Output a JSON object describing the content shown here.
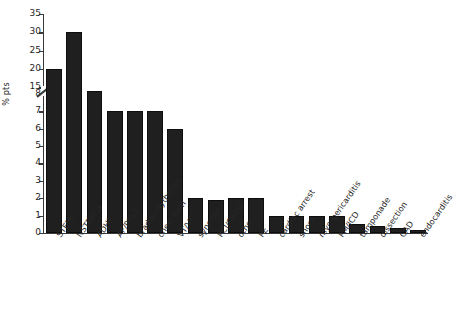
{
  "chart_data": {
    "type": "bar",
    "title": "",
    "subtitle": "",
    "xlabel": "",
    "ylabel": "% pts",
    "grid": false,
    "legend": null,
    "axis_break": {
      "present": true,
      "between": [
        8,
        15
      ],
      "marker": "diagonal-slash"
    },
    "yticks": [
      0,
      1,
      2,
      3,
      4,
      5,
      6,
      7,
      8,
      15,
      20,
      25,
      30,
      35
    ],
    "ylim": [
      0,
      35
    ],
    "categories": [
      "STEMI",
      "NSTEACS",
      "ADHF",
      "AF/PSVT",
      "bradiarrhythmias",
      "chest pain",
      "VT/VF",
      "syncope",
      "PCI/CABG",
      "other",
      "PE",
      "cardiac arrest",
      "shock",
      "myo-pericarditis",
      "PM/ICD",
      "tamponade",
      "dissection",
      "CAD",
      "endocarditis"
    ],
    "values": [
      20,
      30,
      14,
      7,
      7,
      7,
      6,
      2,
      1.9,
      2,
      2,
      1,
      1,
      1,
      1,
      0.5,
      0.4,
      0.3,
      0.2
    ],
    "bar_color": "#1f1f1f"
  },
  "axis": {
    "ylabel": "% pts",
    "ytick_labels": [
      "35",
      "30",
      "25",
      "20",
      "15",
      "8",
      "7",
      "6",
      "5",
      "4",
      "3",
      "2",
      "1",
      "0"
    ]
  }
}
